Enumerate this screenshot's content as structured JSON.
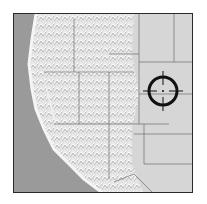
{
  "map": {
    "description": "Grayscale shaded-relief map of the western United States with state boundaries",
    "colors": {
      "ocean": "#9a9a9a",
      "land_light": "#e6e6e6",
      "land_plains": "#d4d4d4",
      "relief_shadow": "#a8a8a8",
      "border": "#2a2a2a",
      "state_lines": "#6e6e6e",
      "marker": "#111111"
    },
    "marker": {
      "type": "crosshair-target",
      "cx": 149,
      "cy": 77,
      "r": 14
    }
  }
}
